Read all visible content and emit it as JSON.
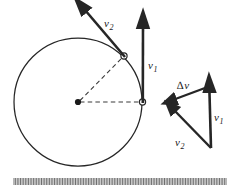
{
  "figure": {
    "stroke_color": "#262626",
    "dash_color": "#3a3a3a",
    "background": "#ffffff"
  },
  "labels": {
    "v1_circle": {
      "symbol": "v",
      "subscript": "1",
      "x": 148,
      "y": 63
    },
    "v2_circle": {
      "symbol": "v",
      "subscript": "2",
      "x": 104,
      "y": 14
    },
    "delta_v": {
      "delta": "∆",
      "symbol": "v",
      "x": 177,
      "y": 78
    },
    "v1_triangle": {
      "symbol": "v",
      "subscript": "1",
      "x": 214,
      "y": 113
    },
    "v2_triangle": {
      "symbol": "v",
      "subscript": "2",
      "x": 175,
      "y": 137
    }
  },
  "circle": {
    "center_x": 78,
    "center_y": 102,
    "radius": 64,
    "center_dot_label": "center-point",
    "point_v1": {
      "x": 142,
      "y": 102
    },
    "point_v2": {
      "x": 124,
      "y": 56
    }
  },
  "vectors": {
    "v1_on_circle": {
      "from_x": 142,
      "from_y": 102,
      "to_x": 143,
      "to_y": 22
    },
    "v2_on_circle": {
      "from_x": 124,
      "from_y": 56,
      "to_x": 81,
      "to_y": 6
    },
    "radius_to_v1": {
      "from_x": 78,
      "from_y": 102,
      "to_x": 142,
      "to_y": 102
    },
    "radius_to_v2": {
      "from_x": 78,
      "from_y": 102,
      "to_x": 124,
      "to_y": 56
    }
  },
  "triangle": {
    "apex_x": 209,
    "apex_y": 86,
    "left_x": 170,
    "left_y": 108,
    "bottom_x": 211,
    "bottom_y": 148,
    "v1_side": {
      "from_x": 211,
      "from_y": 148,
      "to_x": 209,
      "to_y": 86
    },
    "deltav_side": {
      "from_x": 209,
      "from_y": 86,
      "to_x": 170,
      "to_y": 101
    },
    "v2_side": {
      "from_x": 211,
      "from_y": 148,
      "to_x": 170,
      "to_y": 106
    }
  },
  "hatch_strip": {
    "x_start": 14,
    "x_end": 226,
    "y": 178,
    "tick_height": 7,
    "tick_count": 132,
    "color": "#555555"
  }
}
